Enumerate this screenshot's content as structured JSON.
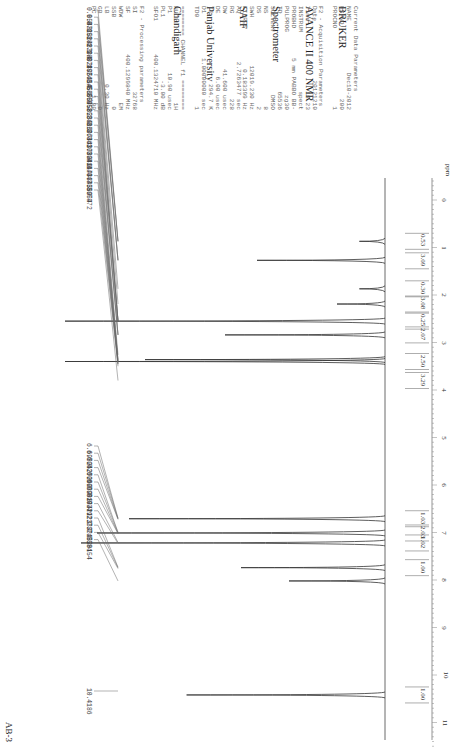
{
  "sample_label": "AB-3",
  "header": {
    "lines": [
      "BRUKER",
      "AVANCE II 400 NMR",
      "Spectrometer",
      "SAIF",
      "Panjab University",
      "Chandigarh"
    ]
  },
  "parameters": {
    "current": {
      "title": "Current Data Parameters",
      "rows": [
        [
          "NAME",
          "Dec10-2012"
        ],
        [
          "EXPNO",
          "200"
        ],
        [
          "PROCNO",
          "1"
        ]
      ]
    },
    "acquisition": {
      "title": "F2 - Acquisition Parameters",
      "rows": [
        [
          "Date_",
          "20121210"
        ],
        [
          "Time",
          "18.23"
        ],
        [
          "INSTRUM",
          "spect"
        ],
        [
          "PROBHD",
          "5 mm PABBO BB-"
        ],
        [
          "PULPROG",
          "zg30"
        ],
        [
          "TD",
          "65536"
        ],
        [
          "SOLVENT",
          "DMSO"
        ],
        [
          "NS",
          "8"
        ],
        [
          "DS",
          "2"
        ],
        [
          "SWH",
          "12019.230 Hz"
        ],
        [
          "FIDRES",
          "0.183399 Hz"
        ],
        [
          "AQ",
          "2.7263477 sec"
        ],
        [
          "RG",
          "228"
        ],
        [
          "DW",
          "41.600 usec"
        ],
        [
          "DE",
          "6.00 usec"
        ],
        [
          "TE",
          "294.7 K"
        ],
        [
          "D1",
          "1.00000000 sec"
        ],
        [
          "TD0",
          "1"
        ]
      ]
    },
    "channel": {
      "title": "======== CHANNEL f1 ========",
      "rows": [
        [
          "NUC1",
          "1H"
        ],
        [
          "P1",
          "10.90 usec"
        ],
        [
          "PL1",
          "-3.00 dB"
        ],
        [
          "SFO1",
          "400.1324710 MHz"
        ]
      ]
    },
    "processing": {
      "title": "F2 - Processing parameters",
      "rows": [
        [
          "SI",
          "32768"
        ],
        [
          "SF",
          "400.1299840 MHz"
        ],
        [
          "WDW",
          "EM"
        ],
        [
          "SSB",
          "0"
        ],
        [
          "LB",
          "0.30 Hz"
        ],
        [
          "GB",
          "0"
        ],
        [
          "PC",
          "1.00"
        ]
      ]
    }
  },
  "axis": {
    "unit": "ppm",
    "ticks": [
      "0",
      "1",
      "2",
      "3",
      "4",
      "5",
      "6",
      "7",
      "8",
      "9",
      "10",
      "11"
    ]
  },
  "peak_labels": {
    "group1": [
      "0.8548",
      "0.8725",
      "0.8888",
      "1.2483",
      "1.2794",
      "1.2892",
      "1.8749",
      "2.1876",
      "2.5414",
      "2.5456",
      "2.5500",
      "2.5545",
      "2.5585",
      "2.8235",
      "2.8416",
      "2.8597",
      "3.2644",
      "3.3610",
      "3.3788",
      "3.3940",
      "3.4117",
      "3.4433",
      "3.4473",
      "3.4589",
      "3.5054",
      "3.7972"
    ],
    "group2": [
      "6.6982",
      "6.7042",
      "6.7200",
      "6.7260",
      "6.9939",
      "6.9998",
      "7.0194",
      "7.0249",
      "7.2121",
      "7.2339",
      "7.7321",
      "7.7452",
      "7.7584",
      "8.0154"
    ],
    "group3": [
      "10.4186"
    ]
  },
  "integrals": [
    "0.53",
    "3.09",
    "0.30",
    "3.08",
    "0.25",
    "2.07",
    "2.50",
    "3.29",
    "1.03",
    "2.03",
    "1.02",
    "1.00",
    "1.00"
  ],
  "chart_data": {
    "type": "line",
    "xlabel": "ppm",
    "ylabel": "",
    "xlim": [
      11.5,
      -0.5
    ],
    "x_ticks": [
      0,
      1,
      2,
      3,
      4,
      5,
      6,
      7,
      8,
      9,
      10,
      11
    ],
    "peaks": [
      {
        "ppm": 0.87,
        "rel_height": 0.08
      },
      {
        "ppm": 1.27,
        "rel_height": 0.4
      },
      {
        "ppm": 1.87,
        "rel_height": 0.08
      },
      {
        "ppm": 2.19,
        "rel_height": 0.15
      },
      {
        "ppm": 2.55,
        "rel_height": 1.0
      },
      {
        "ppm": 2.84,
        "rel_height": 0.5
      },
      {
        "ppm": 3.36,
        "rel_height": 0.75
      },
      {
        "ppm": 3.4,
        "rel_height": 1.0
      },
      {
        "ppm": 6.71,
        "rel_height": 0.8
      },
      {
        "ppm": 7.01,
        "rel_height": 0.9
      },
      {
        "ppm": 7.22,
        "rel_height": 0.95
      },
      {
        "ppm": 7.74,
        "rel_height": 0.45
      },
      {
        "ppm": 8.02,
        "rel_height": 0.3
      },
      {
        "ppm": 10.42,
        "rel_height": 0.62
      }
    ],
    "integrals": [
      {
        "ppm": 0.87,
        "value": 0.53
      },
      {
        "ppm": 1.28,
        "value": 3.09
      },
      {
        "ppm": 1.87,
        "value": 0.3
      },
      {
        "ppm": 2.19,
        "value": 3.08
      },
      {
        "ppm": 2.55,
        "value": 0.25
      },
      {
        "ppm": 2.84,
        "value": 2.07
      },
      {
        "ppm": 3.4,
        "value": 2.5
      },
      {
        "ppm": 3.8,
        "value": 3.29
      },
      {
        "ppm": 6.71,
        "value": 1.03
      },
      {
        "ppm": 7.01,
        "value": 2.03
      },
      {
        "ppm": 7.22,
        "value": 1.02
      },
      {
        "ppm": 7.74,
        "value": 1.0
      },
      {
        "ppm": 10.42,
        "value": 1.0
      }
    ]
  }
}
